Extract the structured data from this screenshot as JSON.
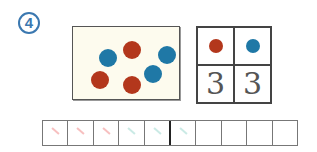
{
  "exercise": {
    "number_label": "4"
  },
  "colors": {
    "red": "#b3371c",
    "blue": "#1f78a6",
    "badge": "#3b78b0"
  },
  "card": {
    "dots": [
      {
        "color": "blue",
        "x": 35,
        "y": 31
      },
      {
        "color": "red",
        "x": 59,
        "y": 23
      },
      {
        "color": "blue",
        "x": 94,
        "y": 28
      },
      {
        "color": "red",
        "x": 27,
        "y": 53
      },
      {
        "color": "red",
        "x": 59,
        "y": 58
      },
      {
        "color": "blue",
        "x": 80,
        "y": 47
      }
    ]
  },
  "tally_grid": {
    "headers": [
      {
        "color": "red",
        "label": "red-dot"
      },
      {
        "color": "blue",
        "label": "blue-dot"
      }
    ],
    "counts": [
      "3",
      "3"
    ]
  },
  "strip": {
    "cell_count": 10,
    "divider_after": 5,
    "marks": [
      {
        "cell": 0,
        "color": "#f08a8a"
      },
      {
        "cell": 1,
        "color": "#f08a8a"
      },
      {
        "cell": 2,
        "color": "#f08a8a"
      },
      {
        "cell": 3,
        "color": "#9fd8d0"
      },
      {
        "cell": 4,
        "color": "#9fd8d0"
      },
      {
        "cell": 5,
        "color": "#9fd8d0"
      }
    ]
  }
}
